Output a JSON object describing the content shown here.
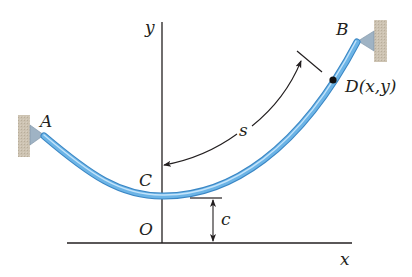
{
  "figure": {
    "labels": {
      "axis_y": "y",
      "axis_x": "x",
      "support_a": "A",
      "support_b": "B",
      "lowest_point": "C",
      "origin": "O",
      "point_d": "D(x,y)",
      "arc_length": "s",
      "sag_offset": "c"
    },
    "colors": {
      "cable": "#5aa7dc",
      "cable_highlight": "#b9defa",
      "cable_edge": "#3a86c4",
      "wall": "#c9bfae",
      "bracket": "#8ea4b6",
      "line": "#231f20"
    }
  }
}
